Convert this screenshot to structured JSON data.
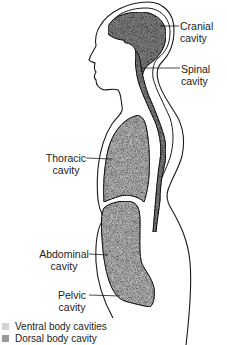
{
  "labels": {
    "cranial": {
      "line1": "Cranial",
      "line2": "cavity"
    },
    "spinal": {
      "line1": "Spinal",
      "line2": "cavity"
    },
    "thoracic": {
      "line1": "Thoracic",
      "line2": "cavity"
    },
    "abdominal": {
      "line1": "Abdominal",
      "line2": "cavity"
    },
    "pelvic": {
      "line1": "Pelvic",
      "line2": "cavity"
    }
  },
  "legend": {
    "items": [
      {
        "label": "Ventral body cavities",
        "color": "#d4d4d4"
      },
      {
        "label": "Dorsal body cavity",
        "color": "#9a9a9a"
      }
    ]
  },
  "colors": {
    "outline": "#1a1a1a",
    "ventral_fill": "#cfcfcf",
    "dorsal_fill": "#8f8f8f",
    "text": "#222222"
  }
}
